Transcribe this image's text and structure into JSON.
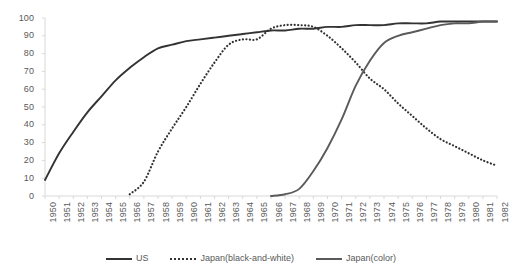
{
  "chart_data": {
    "type": "line",
    "title": "",
    "subtitle": "",
    "xlabel": "",
    "ylabel": "",
    "ylim": [
      0,
      100
    ],
    "yticks": [
      0,
      10,
      20,
      30,
      40,
      50,
      60,
      70,
      80,
      90,
      100
    ],
    "grid": false,
    "legend_position": "bottom",
    "categories": [
      "1950",
      "1951",
      "1952",
      "1953",
      "1954",
      "1955",
      "1956",
      "1957",
      "1958",
      "1959",
      "1960",
      "1961",
      "1962",
      "1963",
      "1964",
      "1965",
      "1966",
      "1967",
      "1968",
      "1969",
      "1970",
      "1971",
      "1972",
      "1973",
      "1974",
      "1975",
      "1976",
      "1977",
      "1978",
      "1979",
      "1980",
      "1981",
      "1982"
    ],
    "series": [
      {
        "name": "US",
        "color": "#333333",
        "style": "solid",
        "values": [
          9,
          24,
          36,
          47,
          56,
          65,
          72,
          78,
          83,
          85,
          87,
          88,
          89,
          90,
          91,
          92,
          93,
          93,
          94,
          94,
          95,
          95,
          96,
          96,
          96,
          97,
          97,
          97,
          98,
          98,
          98,
          98,
          98
        ]
      },
      {
        "name": "Japan(black-and-white)",
        "color": "#333333",
        "style": "dotted",
        "values": [
          null,
          null,
          null,
          null,
          null,
          null,
          1,
          8,
          25,
          38,
          50,
          63,
          75,
          85,
          88,
          88,
          94,
          96,
          96,
          95,
          90,
          83,
          75,
          66,
          60,
          52,
          45,
          38,
          32,
          28,
          24,
          20,
          17
        ]
      },
      {
        "name": "Japan(color)",
        "color": "#5a5a5a",
        "style": "solid",
        "values": [
          null,
          null,
          null,
          null,
          null,
          null,
          null,
          null,
          null,
          null,
          null,
          null,
          null,
          null,
          null,
          null,
          0,
          1,
          4,
          14,
          27,
          43,
          62,
          76,
          86,
          90,
          92,
          94,
          96,
          97,
          97,
          98,
          98
        ]
      }
    ]
  },
  "legend": {
    "items": [
      {
        "label": "US",
        "style": "solid-dark"
      },
      {
        "label": "Japan(black-and-white)",
        "style": "dotted-dark"
      },
      {
        "label": "Japan(color)",
        "style": "solid-gray"
      }
    ]
  },
  "axes": {
    "y_tick_labels": [
      "100",
      "90",
      "80",
      "70",
      "60",
      "50",
      "40",
      "30",
      "20",
      "10",
      "0"
    ],
    "axis_color": "#d9d9d9"
  }
}
